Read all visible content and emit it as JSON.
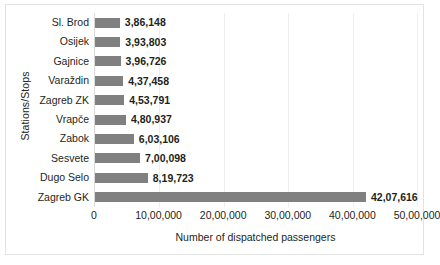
{
  "chart_data": {
    "type": "bar",
    "orientation": "horizontal",
    "title": "",
    "xlabel": "Number of dispatched passengers",
    "ylabel": "Stations/Stops",
    "xlim": [
      0,
      5000000
    ],
    "grid": true,
    "legend": false,
    "bar_color": "#808080",
    "categories": [
      "Sl. Brod",
      "Osijek",
      "Gajnice",
      "Varaždin",
      "Zagreb ZK",
      "Vrapče",
      "Zabok",
      "Sesvete",
      "Dugo Selo",
      "Zagreb GK"
    ],
    "values": [
      386148,
      393803,
      396726,
      437458,
      453791,
      480937,
      603106,
      700098,
      819723,
      4207616
    ],
    "value_labels": [
      "3,86,148",
      "3,93,803",
      "3,96,726",
      "4,37,458",
      "4,53,791",
      "4,80,937",
      "6,03,106",
      "7,00,098",
      "8,19,723",
      "42,07,616"
    ],
    "xticks": [
      0,
      1000000,
      2000000,
      3000000,
      4000000,
      5000000
    ],
    "xtick_labels": [
      "0",
      "10,00,000",
      "20,00,000",
      "30,00,000",
      "40,00,000",
      "50,00,000"
    ]
  }
}
